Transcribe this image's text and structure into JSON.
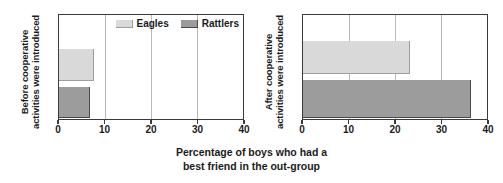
{
  "chart_data": {
    "type": "bar",
    "orientation": "horizontal",
    "title": "",
    "xlabel_line1": "Percentage of boys who had a",
    "xlabel_line2": "best friend in the out-group",
    "ylabel": "",
    "xlim": [
      0,
      40
    ],
    "xticks": [
      0,
      10,
      20,
      30,
      40
    ],
    "xticklabels": [
      "0",
      "10",
      "20",
      "30",
      "40"
    ],
    "grid": true,
    "grid_axis": "x",
    "legend": {
      "position": "top-right-inside-left-panel",
      "entries": [
        {
          "name": "Eagles",
          "color": "#d9d9d9"
        },
        {
          "name": "Rattlers",
          "color": "#9c9c9c"
        }
      ]
    },
    "categories": [
      "Eagles",
      "Rattlers"
    ],
    "panels": [
      {
        "panel_label_line1": "Before cooperative",
        "panel_label_line2": "activities were introduced",
        "series": [
          {
            "name": "Eagles",
            "value": 7.5
          },
          {
            "name": "Rattlers",
            "value": 6.8
          }
        ]
      },
      {
        "panel_label_line1": "After cooperative",
        "panel_label_line2": "activities were introduced",
        "series": [
          {
            "name": "Eagles",
            "value": 23.2
          },
          {
            "name": "Rattlers",
            "value": 36.5
          }
        ]
      }
    ]
  },
  "colors": {
    "eagles_fill": "#d9d9d9",
    "eagles_edge": "#9e9e9e",
    "rattlers_fill": "#9c9c9c",
    "rattlers_edge": "#4a4a4a",
    "axis": "#3a3a3a",
    "gridline": "#b9b9b9",
    "text": "#1b1b1b",
    "background": "#ffffff"
  }
}
